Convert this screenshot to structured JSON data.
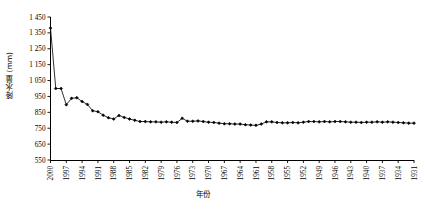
{
  "chart_data": {
    "type": "line",
    "title": "",
    "xlabel": "年份",
    "ylabel": "降水量 (mm)",
    "ylim": [
      550,
      1450
    ],
    "y_ticks": [
      550,
      650,
      750,
      850,
      950,
      1050,
      1150,
      1250,
      1350,
      1450
    ],
    "y_tick_labels": [
      "550",
      "650",
      "750",
      "850",
      "950",
      "1 050",
      "1 150",
      "1 250",
      "1 350",
      "1 450"
    ],
    "x_ticks": [
      2000,
      1997,
      1994,
      1991,
      1988,
      1985,
      1982,
      1979,
      1976,
      1973,
      1970,
      1967,
      1964,
      1961,
      1958,
      1955,
      1952,
      1949,
      1946,
      1943,
      1940,
      1937,
      1934,
      1931
    ],
    "x_tick_labels": [
      "2000",
      "1997",
      "1994",
      "1991",
      "1988",
      "1985",
      "1982",
      "1979",
      "1976",
      "1973",
      "1970",
      "1967",
      "1964",
      "1961",
      "1958",
      "1955",
      "1952",
      "1949",
      "1946",
      "1943",
      "1940",
      "1937",
      "1934",
      "1931"
    ],
    "x_direction": "descending",
    "xlim": [
      2000,
      1931
    ],
    "grid": false,
    "legend": false,
    "marker": "filled-diamond",
    "line_color": "#000000",
    "marker_color": "#000000",
    "x": [
      2000,
      1999,
      1998,
      1997,
      1996,
      1995,
      1994,
      1993,
      1992,
      1991,
      1990,
      1989,
      1988,
      1987,
      1986,
      1985,
      1984,
      1983,
      1982,
      1981,
      1980,
      1979,
      1978,
      1977,
      1976,
      1975,
      1974,
      1973,
      1972,
      1971,
      1970,
      1969,
      1968,
      1967,
      1966,
      1965,
      1964,
      1963,
      1962,
      1961,
      1960,
      1959,
      1958,
      1957,
      1956,
      1955,
      1954,
      1953,
      1952,
      1951,
      1950,
      1949,
      1948,
      1947,
      1946,
      1945,
      1944,
      1943,
      1942,
      1941,
      1940,
      1939,
      1938,
      1937,
      1936,
      1935,
      1934,
      1933,
      1932,
      1931
    ],
    "values": [
      1380,
      1000,
      1000,
      898,
      938,
      942,
      918,
      900,
      860,
      854,
      832,
      816,
      808,
      830,
      818,
      808,
      800,
      792,
      792,
      790,
      790,
      788,
      790,
      788,
      786,
      812,
      794,
      794,
      796,
      792,
      788,
      786,
      782,
      778,
      778,
      776,
      776,
      772,
      770,
      768,
      776,
      790,
      790,
      786,
      784,
      784,
      786,
      784,
      788,
      792,
      792,
      790,
      792,
      790,
      792,
      792,
      790,
      788,
      788,
      786,
      788,
      788,
      790,
      788,
      790,
      788,
      786,
      784,
      782,
      782
    ]
  }
}
